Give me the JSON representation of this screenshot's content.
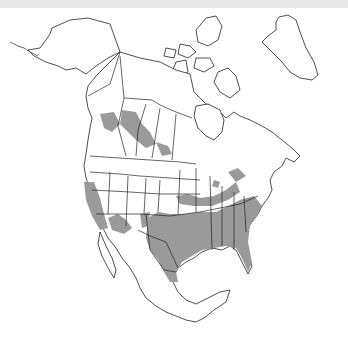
{
  "map": {
    "title": "",
    "region": "North America",
    "legend": [],
    "colors": {
      "background": "#ffffff",
      "top_band": "#e8e8e8",
      "land": "#ffffff",
      "outline": "#222222",
      "range_fill": "#9a9a9a"
    },
    "range_description": "Shaded distribution across southern United States, California, southwestern US, and patches in western Canadian prairies"
  }
}
